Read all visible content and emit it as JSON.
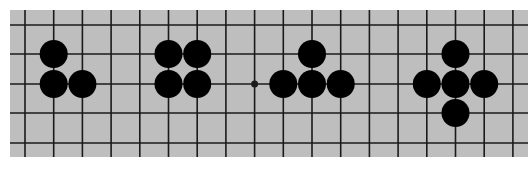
{
  "diagram": {
    "type": "go-board-fragment",
    "board": {
      "left": 10,
      "top": 10,
      "right": 528,
      "bottom": 157,
      "color": "#bebebe",
      "line_color": "#1a1a1a"
    },
    "grid": {
      "columns": 18,
      "rows": 5,
      "x0": 25,
      "x_step": 28.7,
      "row_y": [
        25,
        54,
        84,
        113,
        143
      ]
    },
    "stone": {
      "color": "#000000",
      "radius": 14
    },
    "star_points": [
      {
        "col": 8,
        "row": 2
      }
    ],
    "groups": [
      {
        "name": "group-three-stones-bent",
        "stones": [
          {
            "col": 1,
            "row": 1
          },
          {
            "col": 1,
            "row": 2
          },
          {
            "col": 2,
            "row": 2
          }
        ]
      },
      {
        "name": "group-four-stones-square",
        "stones": [
          {
            "col": 5,
            "row": 1
          },
          {
            "col": 6,
            "row": 1
          },
          {
            "col": 5,
            "row": 2
          },
          {
            "col": 6,
            "row": 2
          }
        ]
      },
      {
        "name": "group-four-stones-t-shape",
        "stones": [
          {
            "col": 10,
            "row": 1
          },
          {
            "col": 9,
            "row": 2
          },
          {
            "col": 10,
            "row": 2
          },
          {
            "col": 11,
            "row": 2
          }
        ]
      },
      {
        "name": "group-five-stones-cross",
        "stones": [
          {
            "col": 15,
            "row": 1
          },
          {
            "col": 14,
            "row": 2
          },
          {
            "col": 15,
            "row": 2
          },
          {
            "col": 16,
            "row": 2
          },
          {
            "col": 15,
            "row": 3
          }
        ]
      }
    ]
  }
}
